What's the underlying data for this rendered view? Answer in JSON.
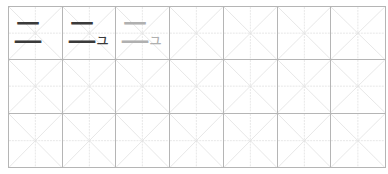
{
  "worksheet": {
    "rows": 3,
    "columns": 7,
    "colors": {
      "border": "#b5b5b5",
      "guide": "#e0e0e0",
      "ink": "#3a3a3a",
      "trace": "#b0b0b0"
    },
    "cells": [
      {
        "main": "二",
        "suffix": "",
        "style": "ink"
      },
      {
        "main": "二",
        "suffix": "ュ",
        "style": "ink"
      },
      {
        "main": "二",
        "suffix": "ュ",
        "style": "trace"
      }
    ]
  }
}
